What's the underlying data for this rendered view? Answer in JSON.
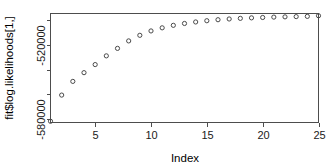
{
  "chart_data": {
    "type": "scatter",
    "title": "",
    "xlabel": "Index",
    "ylabel": "fit$log.likelihoods[1,]",
    "xlim": [
      1,
      25
    ],
    "ylim": [
      -582500,
      -495000
    ],
    "grid": false,
    "legend": null,
    "marker": "open-circle",
    "x": [
      1,
      2,
      3,
      4,
      5,
      6,
      7,
      8,
      9,
      10,
      11,
      12,
      13,
      14,
      15,
      16,
      17,
      18,
      19,
      20,
      21,
      22,
      23,
      24,
      25
    ],
    "values": [
      -581500,
      -560500,
      -549500,
      -542500,
      -536000,
      -529000,
      -523000,
      -517000,
      -512500,
      -509000,
      -506500,
      -504500,
      -503000,
      -501800,
      -500800,
      -500000,
      -499400,
      -498900,
      -498500,
      -498200,
      -497900,
      -497700,
      -497500,
      -497300,
      -496800
    ],
    "xticks": [
      5,
      10,
      15,
      20,
      25
    ],
    "xtick_labels": [
      "5",
      "10",
      "15",
      "20",
      "25"
    ],
    "yticks": [
      -580000,
      -560000,
      -540000,
      -520000,
      -500000
    ],
    "ytick_labels": [
      "-580000",
      "",
      "",
      "-520000",
      ""
    ],
    "ytick_labels_shown": [
      "-580000",
      "-520000"
    ]
  },
  "axes": {
    "x_title": "Index",
    "y_title": "fit$log.likelihoods[1,]"
  }
}
